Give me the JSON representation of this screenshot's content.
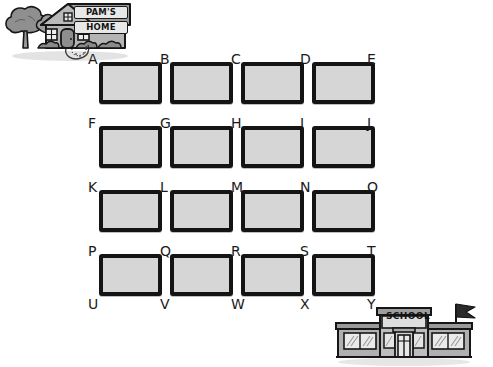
{
  "worksheet": {
    "background_color": "#ffffff",
    "square_fill_color": "#d6d6d6",
    "ink_color": "#141414"
  },
  "home": {
    "name": "pams-home",
    "sign_line_1": "PAM'S",
    "sign_line_2": "HOME",
    "features": [
      "tree",
      "house",
      "door",
      "windows",
      "chimney-vent",
      "bushes",
      "curved-path"
    ]
  },
  "school": {
    "name": "school",
    "sign_text": "SCHOOL",
    "features": [
      "flag",
      "flagpole",
      "double-doors",
      "windows",
      "roof-parapet"
    ]
  },
  "grid": {
    "rows": 5,
    "cols": 5,
    "square_rows": 4,
    "square_cols": 4,
    "labels": [
      [
        "A",
        "B",
        "C",
        "D",
        "E"
      ],
      [
        "F",
        "G",
        "H",
        "I",
        "J"
      ],
      [
        "K",
        "L",
        "M",
        "N",
        "O"
      ],
      [
        "P",
        "Q",
        "R",
        "S",
        "T"
      ],
      [
        "U",
        "V",
        "W",
        "X",
        "Y"
      ]
    ],
    "labels_flat": [
      "A",
      "B",
      "C",
      "D",
      "E",
      "F",
      "G",
      "H",
      "I",
      "J",
      "K",
      "L",
      "M",
      "N",
      "O",
      "P",
      "Q",
      "R",
      "S",
      "T",
      "U",
      "V",
      "W",
      "X",
      "Y"
    ],
    "start_label": "A",
    "end_label": "Y"
  },
  "chart_data": {
    "type": "table",
    "title": "",
    "categories": [
      "col-1",
      "col-2",
      "col-3",
      "col-4",
      "col-5"
    ],
    "rows": [
      [
        "A",
        "B",
        "C",
        "D",
        "E"
      ],
      [
        "F",
        "G",
        "H",
        "I",
        "J"
      ],
      [
        "K",
        "L",
        "M",
        "N",
        "O"
      ],
      [
        "P",
        "Q",
        "R",
        "S",
        "T"
      ],
      [
        "U",
        "V",
        "W",
        "X",
        "Y"
      ]
    ]
  }
}
